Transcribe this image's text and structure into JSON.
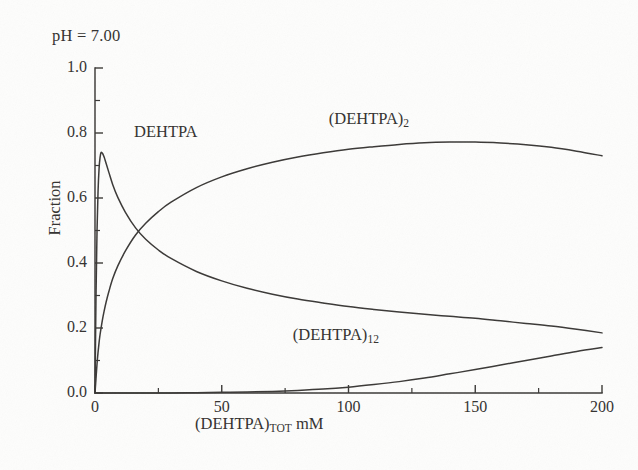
{
  "figure": {
    "annotation": "pH = 7.00",
    "background_color": "#fdfdfc",
    "ink_color": "#3a3836"
  },
  "chart_data": {
    "type": "line",
    "title": "pH = 7.00",
    "xlabel_main": "(DEHTPA)",
    "xlabel_sub": "TOT",
    "xlabel_unit": " mM",
    "ylabel": "Fraction",
    "xlim": [
      0,
      200
    ],
    "ylim": [
      0.0,
      1.0
    ],
    "xticks": [
      0,
      50,
      100,
      150,
      200
    ],
    "xtick_labels": [
      "0",
      "50",
      "100",
      "150",
      "200"
    ],
    "yticks": [
      0.0,
      0.2,
      0.4,
      0.6,
      0.8,
      1.0
    ],
    "ytick_labels": [
      "0.0",
      "0.2",
      "0.4",
      "0.6",
      "0.8",
      "1.0"
    ],
    "minor_ytick_step": 0.1,
    "grid": false,
    "legend": "inline-curve-labels",
    "series": [
      {
        "name": "DEHTPA",
        "label_main": "DEHTPA",
        "label_sub": "",
        "label_x": 28,
        "label_y": 0.8,
        "x": [
          0,
          0.4,
          0.8,
          1.2,
          1.6,
          2.0,
          2.4,
          3.0,
          3.6,
          4.4,
          5.5,
          7,
          9,
          12,
          16,
          20,
          25,
          30,
          40,
          50,
          60,
          70,
          80,
          90,
          100,
          110,
          120,
          130,
          140,
          150,
          160,
          170,
          180,
          190,
          200
        ],
        "y": [
          0.0,
          0.3,
          0.5,
          0.62,
          0.69,
          0.725,
          0.74,
          0.737,
          0.726,
          0.706,
          0.678,
          0.641,
          0.602,
          0.556,
          0.508,
          0.473,
          0.44,
          0.414,
          0.374,
          0.345,
          0.322,
          0.304,
          0.289,
          0.277,
          0.266,
          0.257,
          0.249,
          0.242,
          0.236,
          0.23,
          0.222,
          0.214,
          0.206,
          0.196,
          0.185
        ]
      },
      {
        "name": "(DEHTPA)2",
        "label_main": "(DEHTPA)",
        "label_sub": "2",
        "label_x": 108,
        "label_y": 0.84,
        "x": [
          0,
          0.4,
          0.8,
          1.2,
          1.6,
          2.0,
          2.4,
          3.0,
          3.6,
          4.4,
          5.5,
          7,
          9,
          12,
          16,
          20,
          25,
          30,
          40,
          50,
          60,
          70,
          80,
          90,
          100,
          110,
          120,
          130,
          140,
          150,
          160,
          170,
          180,
          190,
          200
        ],
        "y": [
          0.0,
          0.045,
          0.09,
          0.125,
          0.155,
          0.18,
          0.2,
          0.228,
          0.252,
          0.28,
          0.313,
          0.352,
          0.391,
          0.437,
          0.486,
          0.522,
          0.558,
          0.587,
          0.632,
          0.665,
          0.69,
          0.71,
          0.726,
          0.739,
          0.75,
          0.758,
          0.765,
          0.77,
          0.772,
          0.772,
          0.769,
          0.764,
          0.756,
          0.744,
          0.73
        ]
      },
      {
        "name": "(DEHTPA)12",
        "label_main": "(DEHTPA)",
        "label_sub": "12",
        "label_x": 95,
        "label_y": 0.175,
        "x": [
          0,
          5,
          10,
          20,
          30,
          40,
          50,
          60,
          70,
          80,
          90,
          100,
          110,
          120,
          130,
          140,
          150,
          160,
          170,
          180,
          190,
          200
        ],
        "y": [
          0.0,
          0.0,
          0.0,
          0.0,
          0.0,
          0.001,
          0.002,
          0.003,
          0.005,
          0.008,
          0.012,
          0.018,
          0.026,
          0.035,
          0.046,
          0.059,
          0.072,
          0.086,
          0.1,
          0.114,
          0.128,
          0.14
        ]
      }
    ]
  }
}
